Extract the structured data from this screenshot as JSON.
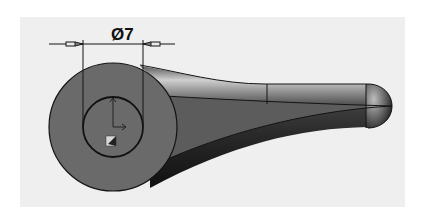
{
  "diagram": {
    "type": "cad-3d-part-view",
    "part_description": "Tapered handle/lever with circular boss end and rounded tip",
    "dimension": {
      "label": "Ø7",
      "symbol": "diameter",
      "value": 7
    },
    "features": [
      "outer-boss-circle",
      "inner-hole-circle",
      "tapered-handle",
      "rounded-tip",
      "coordinate-origin-marker"
    ],
    "colors": {
      "background": "#ffffff",
      "panel": "#efefef",
      "boss_face": "#6a6a6a",
      "edge_line": "#141414",
      "handle_highlight": "#c8c8c8",
      "handle_shadow": "#1e1e1e"
    }
  }
}
